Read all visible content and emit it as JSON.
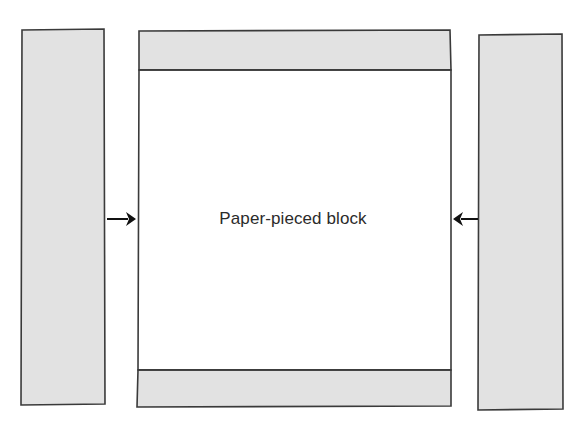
{
  "diagram": {
    "type": "quilting-assembly-diagram",
    "background_color": "#ffffff",
    "center_block": {
      "label": "Paper-pieced block",
      "label_x": 293,
      "label_y": 220,
      "outline_color": "#3a3a3a",
      "body_fill": "#ffffff",
      "top_strip": {
        "name": "top-border-strip",
        "fill": "#e2e2e2",
        "x": 138,
        "y": 30,
        "width": 313,
        "height": 40
      },
      "bottom_strip": {
        "name": "bottom-border-strip",
        "fill": "#e2e2e2",
        "x": 138,
        "y": 370,
        "width": 313,
        "height": 37
      },
      "body": {
        "name": "block-body",
        "x": 138,
        "y": 70,
        "width": 313,
        "height": 300
      }
    },
    "left_strip": {
      "name": "left-border-strip",
      "fill": "#e2e2e2",
      "x": 21,
      "y": 29,
      "width": 84,
      "height": 376
    },
    "right_strip": {
      "name": "right-border-strip",
      "fill": "#e2e2e2",
      "x": 478,
      "y": 34,
      "width": 85,
      "height": 376
    },
    "arrows": [
      {
        "name": "left-arrow",
        "direction": "right",
        "glyph": "→",
        "color": "#111111",
        "from_x": 107,
        "to_x": 135,
        "y": 219
      },
      {
        "name": "right-arrow",
        "direction": "left",
        "glyph": "←",
        "color": "#111111",
        "from_x": 478,
        "to_x": 454,
        "y": 219
      }
    ]
  }
}
